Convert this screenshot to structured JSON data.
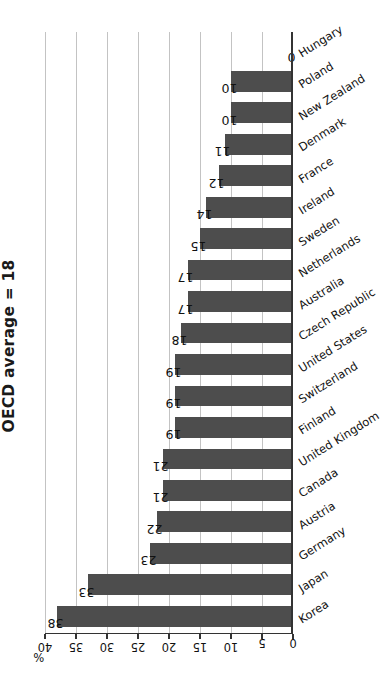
{
  "chart_data": {
    "type": "bar",
    "title": "OECD average = 18",
    "xlabel": "",
    "ylabel": "%",
    "ylim": [
      0,
      40
    ],
    "ytick_labels": [
      "40",
      "35",
      "30",
      "25",
      "20",
      "15",
      "10",
      "5",
      "0"
    ],
    "ytick_values": [
      40,
      35,
      30,
      25,
      20,
      15,
      10,
      5,
      0
    ],
    "grid": true,
    "legend": "none",
    "orientation": "vertical-bars-on-rotated-page",
    "bar_color": "#4d4d4d",
    "gridline_color": "#c3c3c3",
    "axis_color": "#333333",
    "categories": [
      "Korea",
      "Japan",
      "Germany",
      "Austria",
      "Canada",
      "United Kingdom",
      "Finland",
      "Switzerland",
      "United States",
      "Czech Republic",
      "Australia",
      "Netherlands",
      "Sweden",
      "Ireland",
      "France",
      "Denmark",
      "New Zealand",
      "Poland",
      "Hungary"
    ],
    "values": [
      38,
      33,
      23,
      22,
      21,
      21,
      19,
      19,
      19,
      18,
      17,
      17,
      15,
      14,
      12,
      11,
      10,
      10,
      0
    ],
    "data_labels": [
      "38",
      "33",
      "23",
      "22",
      "21",
      "21",
      "19",
      "19",
      "19",
      "18",
      "17",
      "17",
      "15",
      "14",
      "12",
      "11",
      "10",
      "10",
      "0"
    ]
  }
}
